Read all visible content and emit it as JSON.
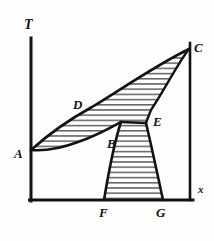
{
  "figure": {
    "kind": "phase-diagram",
    "background_color": "#fefefe",
    "ink_color": "#121212",
    "hatch_color": "#1a1a1a"
  },
  "axes": {
    "vertical": {
      "name": "temperature-axis",
      "label": "T",
      "label_position": {
        "x": 24,
        "y": 18
      },
      "line": {
        "x1": 31,
        "y1": 38,
        "x2": 31,
        "y2": 201
      }
    },
    "horizontal": {
      "name": "composition-axis",
      "label": "x",
      "label_position": {
        "x": 198,
        "y": 184
      },
      "line": {
        "x1": 30,
        "y1": 200,
        "x2": 193,
        "y2": 200
      }
    },
    "right_boundary": {
      "name": "right-vertical-boundary",
      "line": {
        "x1": 190,
        "y1": 43,
        "x2": 190,
        "y2": 200
      }
    }
  },
  "points": [
    {
      "id": "A",
      "label": "A",
      "label_x": 14,
      "label_y": 147,
      "marker_x": 31,
      "marker_y": 150
    },
    {
      "id": "B",
      "label": "B",
      "label_x": 107,
      "label_y": 137,
      "marker_x": 121,
      "marker_y": 122
    },
    {
      "id": "C",
      "label": "C",
      "label_x": 194,
      "label_y": 41,
      "marker_x": 190,
      "marker_y": 49
    },
    {
      "id": "D",
      "label": "D",
      "label_x": 73,
      "label_y": 98,
      "marker_x": 86,
      "marker_y": 110
    },
    {
      "id": "E",
      "label": "E",
      "label_x": 153,
      "label_y": 115,
      "marker_x": 146,
      "marker_y": 123
    },
    {
      "id": "F",
      "label": "F",
      "label_x": 99,
      "label_y": 206,
      "marker_x": 104,
      "marker_y": 200
    },
    {
      "id": "G",
      "label": "G",
      "label_x": 156,
      "label_y": 206,
      "marker_x": 163,
      "marker_y": 200
    }
  ],
  "regions": [
    {
      "id": "upper-lens",
      "name": "upper-two-phase-region",
      "vertices": [
        "A",
        "D",
        "C",
        "E",
        "B"
      ],
      "hatched": true,
      "hatch_direction": "horizontal"
    },
    {
      "id": "lower-funnel",
      "name": "lower-two-phase-region",
      "vertices": [
        "B",
        "E",
        "G",
        "F"
      ],
      "hatched": true,
      "hatch_direction": "horizontal"
    }
  ],
  "curves": [
    {
      "id": "A-D-C",
      "name": "upper-liquidus-curve",
      "from": "A",
      "to": "C",
      "through": "D"
    },
    {
      "id": "A-B",
      "name": "lower-solidus-curve-left",
      "from": "A",
      "to": "B"
    },
    {
      "id": "B-E",
      "name": "solidus-segment-BE",
      "from": "B",
      "to": "E"
    },
    {
      "id": "E-C",
      "name": "solidus-curve-EC",
      "from": "E",
      "to": "C"
    },
    {
      "id": "B-F",
      "name": "left-boundary-funnel",
      "from": "B",
      "to": "F"
    },
    {
      "id": "E-G",
      "name": "right-boundary-funnel",
      "from": "E",
      "to": "G"
    }
  ]
}
